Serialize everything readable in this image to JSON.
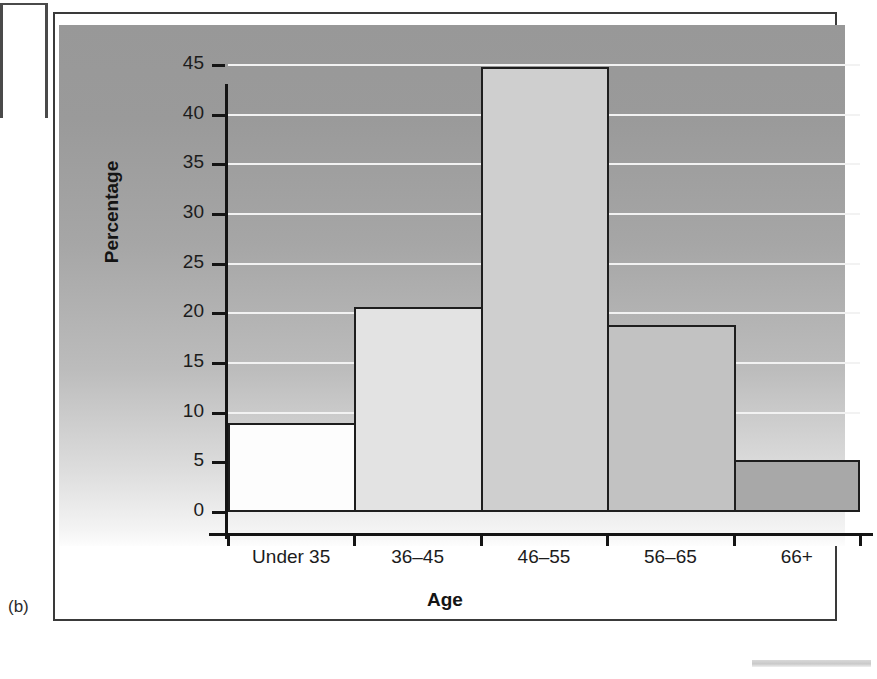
{
  "figure": {
    "label": "(b)"
  },
  "chart_data": {
    "type": "bar",
    "title": "",
    "xlabel": "Age",
    "ylabel": "Percentage",
    "categories": [
      "Under 35",
      "36–45",
      "46–55",
      "56–65",
      "66+"
    ],
    "values": [
      9.0,
      20.6,
      44.8,
      18.8,
      5.2
    ],
    "ylim": [
      0,
      45
    ],
    "ytick_step": 5,
    "yticks": [
      0,
      5,
      10,
      15,
      20,
      25,
      30,
      35,
      40,
      45
    ],
    "ytick_labels": [
      "0",
      "5",
      "10",
      "15",
      "20",
      "25",
      "30",
      "35",
      "40",
      "45"
    ],
    "grid": true,
    "gridline_color": "#f2f2f2",
    "legend": null,
    "bar_colors": [
      "#fdfdfd",
      "#e3e3e3",
      "#cfcfcf",
      "#c2c2c2",
      "#a8a8a8"
    ],
    "bar_edge_color": "#1e1e1e",
    "panel_color_top": "#989898",
    "panel_color_bottom": "#fdfdfd",
    "axis_color": "#141414"
  }
}
